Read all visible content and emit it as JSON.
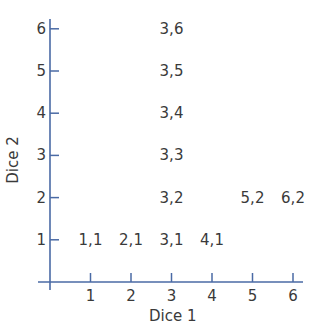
{
  "chart_data": {
    "type": "scatter",
    "title": "",
    "xlabel": "Dice 1",
    "ylabel": "Dice 2",
    "xlim": [
      0,
      6
    ],
    "ylim": [
      0,
      6
    ],
    "x_ticks": [
      "1",
      "2",
      "3",
      "4",
      "5",
      "6"
    ],
    "y_ticks": [
      "1",
      "2",
      "3",
      "4",
      "5",
      "6"
    ],
    "grid": false,
    "points": [
      {
        "x": 1,
        "y": 1,
        "label": "1,1"
      },
      {
        "x": 2,
        "y": 1,
        "label": "2,1"
      },
      {
        "x": 3,
        "y": 1,
        "label": "3,1"
      },
      {
        "x": 4,
        "y": 1,
        "label": "4,1"
      },
      {
        "x": 3,
        "y": 2,
        "label": "3,2"
      },
      {
        "x": 5,
        "y": 2,
        "label": "5,2"
      },
      {
        "x": 6,
        "y": 2,
        "label": "6,2"
      },
      {
        "x": 3,
        "y": 3,
        "label": "3,3"
      },
      {
        "x": 3,
        "y": 4,
        "label": "3,4"
      },
      {
        "x": 3,
        "y": 5,
        "label": "3,5"
      },
      {
        "x": 3,
        "y": 6,
        "label": "3,6"
      }
    ]
  },
  "colors": {
    "axis": "#4a6aa5",
    "text": "#3a3a3a"
  }
}
